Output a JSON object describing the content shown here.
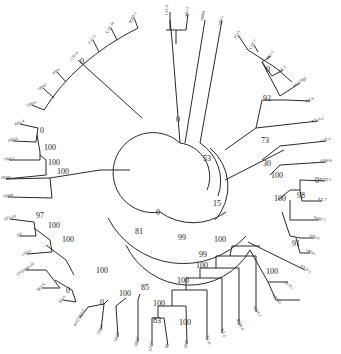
{
  "stroke_color": "#2a2a2a",
  "leaves": [
    {
      "id": "L1",
      "label": "RZH-2",
      "x": 134,
      "y": 18,
      "a": -62
    },
    {
      "id": "L2",
      "label": "CJZ-3a",
      "x": 111,
      "y": 28,
      "a": -62
    },
    {
      "id": "L3",
      "label": "CJZ-2",
      "x": 93,
      "y": 40,
      "a": -55
    },
    {
      "id": "L4",
      "label": "CJZ-4",
      "x": 75,
      "y": 57,
      "a": -50
    },
    {
      "id": "L5",
      "label": "89yx",
      "x": 57,
      "y": 72,
      "a": -40
    },
    {
      "id": "L6",
      "label": "18047",
      "x": 43,
      "y": 88,
      "a": -32
    },
    {
      "id": "L7",
      "label": "100yx",
      "x": 32,
      "y": 105,
      "a": -25
    },
    {
      "id": "L8",
      "label": "MG-4",
      "x": 20,
      "y": 124,
      "a": -22
    },
    {
      "id": "L9",
      "label": "18050",
      "x": 13,
      "y": 141,
      "a": -14
    },
    {
      "id": "L10",
      "label": "18012",
      "x": 9,
      "y": 160,
      "a": -5
    },
    {
      "id": "L11",
      "label": "18080",
      "x": 6,
      "y": 179,
      "a": 0
    },
    {
      "id": "L12",
      "label": "18004",
      "x": 8,
      "y": 197,
      "a": -8
    },
    {
      "id": "L13",
      "label": "XFJ-10",
      "x": 10,
      "y": 219,
      "a": -15
    },
    {
      "id": "L14",
      "label": "DZ",
      "x": 20,
      "y": 236,
      "a": -22
    },
    {
      "id": "L15",
      "label": "138yx",
      "x": 27,
      "y": 254,
      "a": -30
    },
    {
      "id": "L16",
      "label": "LY(mtg)-20",
      "x": 26,
      "y": 270,
      "a": -35
    },
    {
      "id": "L17",
      "label": "86YX",
      "x": 42,
      "y": 288,
      "a": -43
    },
    {
      "id": "L18",
      "label": "84yx",
      "x": 63,
      "y": 300,
      "a": -52
    },
    {
      "id": "L19",
      "label": "mtc(18g)-2",
      "x": 80,
      "y": 318,
      "a": -60
    },
    {
      "id": "L20",
      "label": "18033",
      "x": 101,
      "y": 330,
      "a": -66
    },
    {
      "id": "L21",
      "label": "18022",
      "x": 118,
      "y": 337,
      "a": -74
    },
    {
      "id": "L22",
      "label": "18016",
      "x": 138,
      "y": 342,
      "a": -80
    },
    {
      "id": "L23",
      "label": "XFJ11",
      "x": 152,
      "y": 346,
      "a": -84
    },
    {
      "id": "L24",
      "label": "87",
      "x": 168,
      "y": 346,
      "a": -88
    },
    {
      "id": "L25",
      "label": "96yx",
      "x": 187,
      "y": 344,
      "a": -92
    },
    {
      "id": "L26",
      "label": "XZ-8",
      "x": 207,
      "y": 340,
      "a": 78
    },
    {
      "id": "L27",
      "label": "XZ-5",
      "x": 222,
      "y": 333,
      "a": 72
    },
    {
      "id": "L28",
      "label": "RZH-4",
      "x": 239,
      "y": 325,
      "a": 64
    },
    {
      "id": "L29",
      "label": "XFH-2",
      "x": 256,
      "y": 312,
      "a": 56
    },
    {
      "id": "L30",
      "label": "LYXG",
      "x": 276,
      "y": 300,
      "a": 48
    },
    {
      "id": "L31",
      "label": "LYYG",
      "x": 288,
      "y": 286,
      "a": 40
    },
    {
      "id": "L32",
      "label": "XZ-9-1",
      "x": 305,
      "y": 270,
      "a": 32
    },
    {
      "id": "L33",
      "label": "140yx",
      "x": 310,
      "y": 253,
      "a": 25
    },
    {
      "id": "L34",
      "label": "105yx",
      "x": 314,
      "y": 238,
      "a": 20
    },
    {
      "id": "L35",
      "label": "XFH-7",
      "x": 319,
      "y": 220,
      "a": 14
    },
    {
      "id": "L36",
      "label": "XZ-7",
      "x": 322,
      "y": 201,
      "a": 8
    },
    {
      "id": "L37",
      "label": "XFH-3",
      "x": 325,
      "y": 181,
      "a": 0
    },
    {
      "id": "L38",
      "label": "XFH-6",
      "x": 326,
      "y": 162,
      "a": -4
    },
    {
      "id": "L39",
      "label": "CJZ-1",
      "x": 326,
      "y": 141,
      "a": -12
    },
    {
      "id": "L40",
      "label": "XZ-9-2",
      "x": 318,
      "y": 121,
      "a": -18
    },
    {
      "id": "L41",
      "label": "XZ-6",
      "x": 310,
      "y": 101,
      "a": -26
    },
    {
      "id": "L42",
      "label": "mtc(18g)",
      "x": 300,
      "y": 83,
      "a": -34
    },
    {
      "id": "L43",
      "label": "XZ-1",
      "x": 283,
      "y": 70,
      "a": -42
    },
    {
      "id": "L44",
      "label": "MG-1",
      "x": 271,
      "y": 56,
      "a": -52
    },
    {
      "id": "L45",
      "label": "CJZ-7",
      "x": 254,
      "y": 45,
      "a": -62
    },
    {
      "id": "L46",
      "label": "97yx",
      "x": 238,
      "y": 35,
      "a": -66
    },
    {
      "id": "L47",
      "label": "18011",
      "x": 222,
      "y": 21,
      "a": -72
    },
    {
      "id": "L48",
      "label": "18004",
      "x": 204,
      "y": 16,
      "a": -80
    },
    {
      "id": "L49",
      "label": "MG-2",
      "x": 188,
      "y": 12,
      "a": -86
    },
    {
      "id": "L50",
      "label": "CJT-6",
      "x": 168,
      "y": 10,
      "a": -88
    }
  ],
  "bootstrap": [
    {
      "v": "0",
      "x": 80,
      "y": 64
    },
    {
      "v": "0",
      "x": 40,
      "y": 133
    },
    {
      "v": "100",
      "x": 44,
      "y": 150
    },
    {
      "v": "100",
      "x": 48,
      "y": 165
    },
    {
      "v": "100",
      "x": 57,
      "y": 174
    },
    {
      "v": "97",
      "x": 36,
      "y": 218
    },
    {
      "v": "100",
      "x": 48,
      "y": 228
    },
    {
      "v": "100",
      "x": 62,
      "y": 242
    },
    {
      "v": "0",
      "x": 66,
      "y": 293
    },
    {
      "v": "100",
      "x": 96,
      "y": 273
    },
    {
      "v": "0",
      "x": 100,
      "y": 305
    },
    {
      "v": "100",
      "x": 119,
      "y": 296
    },
    {
      "v": "85",
      "x": 141,
      "y": 290
    },
    {
      "v": "100",
      "x": 153,
      "y": 306
    },
    {
      "v": "83",
      "x": 153,
      "y": 323
    },
    {
      "v": "100",
      "x": 179,
      "y": 325
    },
    {
      "v": "100",
      "x": 177,
      "y": 283
    },
    {
      "v": "100",
      "x": 196,
      "y": 268
    },
    {
      "v": "99",
      "x": 199,
      "y": 257
    },
    {
      "v": "100",
      "x": 214,
      "y": 242
    },
    {
      "v": "81",
      "x": 135,
      "y": 234
    },
    {
      "v": "99",
      "x": 178,
      "y": 240
    },
    {
      "v": "100",
      "x": 266,
      "y": 274
    },
    {
      "v": "0",
      "x": 156,
      "y": 215
    },
    {
      "v": "15",
      "x": 213,
      "y": 206
    },
    {
      "v": "53",
      "x": 203,
      "y": 161
    },
    {
      "v": "0",
      "x": 176,
      "y": 122
    },
    {
      "v": "73",
      "x": 261,
      "y": 143
    },
    {
      "v": "30",
      "x": 263,
      "y": 166
    },
    {
      "v": "100",
      "x": 271,
      "y": 178
    },
    {
      "v": "100",
      "x": 274,
      "y": 201
    },
    {
      "v": "98",
      "x": 297,
      "y": 198
    },
    {
      "v": "91",
      "x": 292,
      "y": 246
    },
    {
      "v": "0",
      "x": 266,
      "y": 72
    },
    {
      "v": "92",
      "x": 263,
      "y": 101
    },
    {
      "v": "0",
      "x": 315,
      "y": 183
    }
  ]
}
